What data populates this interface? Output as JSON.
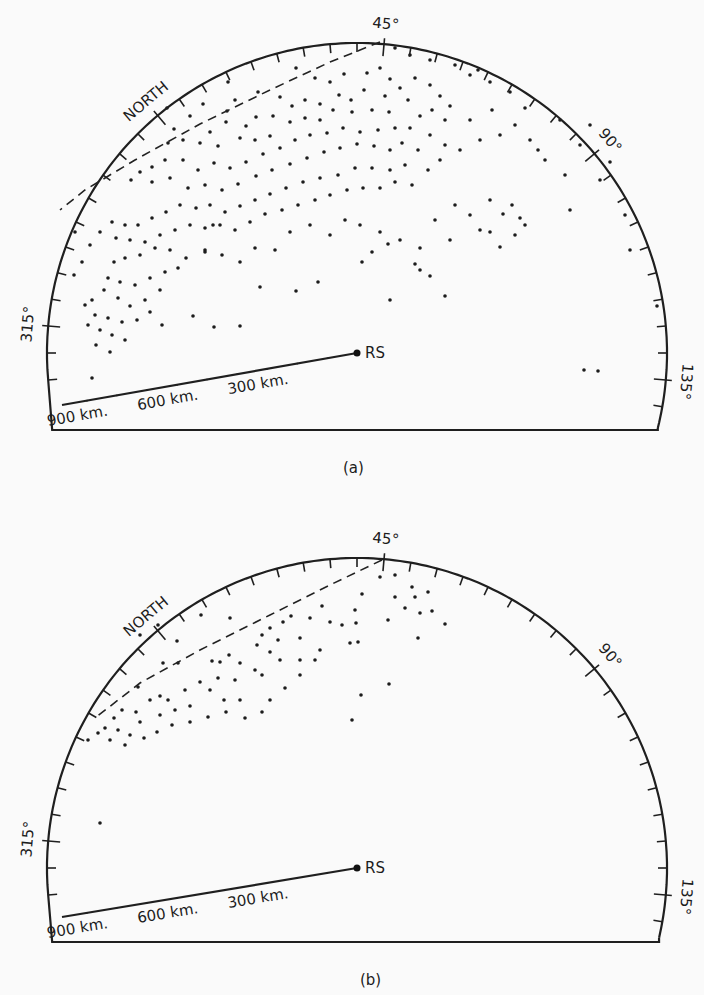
{
  "figure": {
    "panels": [
      {
        "id": "a",
        "caption": "(a)",
        "center": [
          357,
          353
        ],
        "radius": 310,
        "rotation_deg": 5,
        "arc_from_deg": 305,
        "arc_to_deg": 150,
        "baseline_y": 430,
        "range_line_end": [
          62,
          405
        ],
        "north_label": "NORTH",
        "station_label": "RS",
        "bearing_labels": [
          {
            "deg": 45,
            "text": "45°"
          },
          {
            "deg": 90,
            "text": "90°"
          },
          {
            "deg": 135,
            "text": "135°"
          },
          {
            "deg": 315,
            "text": "315°"
          }
        ],
        "range_labels": [
          {
            "km": 300,
            "text": "300 km."
          },
          {
            "km": 600,
            "text": "600 km."
          },
          {
            "km": 900,
            "text": "900 km."
          }
        ],
        "boundary_dashed": [
          [
            380,
            42
          ],
          [
            330,
            62
          ],
          [
            270,
            90
          ],
          [
            200,
            124
          ],
          [
            135,
            160
          ],
          [
            85,
            190
          ],
          [
            60,
            210
          ]
        ],
        "caption_pos": [
          352,
          470
        ]
      },
      {
        "id": "b",
        "caption": "(b)",
        "center": [
          357,
          868
        ],
        "radius": 310,
        "rotation_deg": 5,
        "arc_from_deg": 305,
        "arc_to_deg": 150,
        "baseline_y": 942,
        "range_line_end": [
          62,
          917
        ],
        "north_label": "NORTH",
        "station_label": "RS",
        "bearing_labels": [
          {
            "deg": 45,
            "text": "45°"
          },
          {
            "deg": 90,
            "text": "90°"
          },
          {
            "deg": 135,
            "text": "135°"
          },
          {
            "deg": 315,
            "text": "315°"
          }
        ],
        "range_labels": [
          {
            "km": 300,
            "text": "300 km."
          },
          {
            "km": 600,
            "text": "600 km."
          },
          {
            "km": 900,
            "text": "900 km."
          }
        ],
        "boundary_dashed": [
          [
            382,
            560
          ],
          [
            330,
            585
          ],
          [
            270,
            615
          ],
          [
            200,
            650
          ],
          [
            140,
            683
          ],
          [
            95,
            718
          ]
        ],
        "caption_pos": [
          365,
          980
        ]
      }
    ]
  },
  "chart_data": [
    {
      "type": "scatter",
      "title": "(a)",
      "description": "Polar (bearing/range) plot of echo positions around station RS; dense cluster between ~0° and ~60° bearing at 300–900 km, dashed boundary line near the northern edge",
      "axes": {
        "bearing_ticks_deg": [
          315,
          45,
          90,
          135
        ],
        "range_ticks_km": [
          300,
          600,
          900
        ],
        "tick_interval_deg": 5
      },
      "clusters": [
        {
          "region": "main band NNE",
          "bearing_deg_range": [
            0,
            60
          ],
          "range_km": [
            300,
            950
          ],
          "density": "very high"
        },
        {
          "region": "NW pocket",
          "bearing_deg_range": [
            320,
            345
          ],
          "range_km": [
            700,
            950
          ],
          "density": "high"
        },
        {
          "region": "east scatter",
          "bearing_deg_range": [
            60,
            100
          ],
          "range_km": [
            300,
            900
          ],
          "density": "low"
        },
        {
          "region": "SE isolated",
          "bearing_deg_range": [
            120,
            130
          ],
          "range_km": [
            750,
            900
          ],
          "density": "sparse"
        }
      ]
    },
    {
      "type": "scatter",
      "title": "(b)",
      "description": "Same projection, fewer echoes; clustered in arcs between ~330° and ~60° bearing at 500–950 km",
      "axes": {
        "bearing_ticks_deg": [
          315,
          45,
          90,
          135
        ],
        "range_ticks_km": [
          300,
          600,
          900
        ],
        "tick_interval_deg": 5
      },
      "clusters": [
        {
          "region": "NNE arcs",
          "bearing_deg_range": [
            335,
            40
          ],
          "range_km": [
            550,
            950
          ],
          "density": "moderate"
        },
        {
          "region": "NE group",
          "bearing_deg_range": [
            40,
            60
          ],
          "range_km": [
            650,
            850
          ],
          "density": "low"
        },
        {
          "region": "isolated",
          "bearing_deg_range": [
            300,
            315
          ],
          "range_km": [
            850,
            950
          ],
          "density": "sparse"
        }
      ]
    }
  ],
  "dots": {
    "a": [
      [
        296,
        68
      ],
      [
        315,
        78
      ],
      [
        330,
        82
      ],
      [
        344,
        74
      ],
      [
        367,
        73
      ],
      [
        380,
        68
      ],
      [
        390,
        79
      ],
      [
        385,
        96
      ],
      [
        364,
        90
      ],
      [
        351,
        100
      ],
      [
        339,
        95
      ],
      [
        320,
        104
      ],
      [
        305,
        100
      ],
      [
        292,
        106
      ],
      [
        280,
        97
      ],
      [
        258,
        92
      ],
      [
        235,
        100
      ],
      [
        228,
        82
      ],
      [
        256,
        117
      ],
      [
        273,
        116
      ],
      [
        246,
        126
      ],
      [
        226,
        122
      ],
      [
        210,
        132
      ],
      [
        218,
        146
      ],
      [
        200,
        143
      ],
      [
        183,
        140
      ],
      [
        168,
        143
      ],
      [
        174,
        129
      ],
      [
        167,
        108
      ],
      [
        190,
        116
      ],
      [
        203,
        104
      ],
      [
        227,
        111
      ],
      [
        240,
        138
      ],
      [
        255,
        140
      ],
      [
        270,
        136
      ],
      [
        290,
        122
      ],
      [
        305,
        118
      ],
      [
        320,
        120
      ],
      [
        333,
        110
      ],
      [
        352,
        112
      ],
      [
        372,
        110
      ],
      [
        389,
        112
      ],
      [
        395,
        128
      ],
      [
        378,
        130
      ],
      [
        360,
        132
      ],
      [
        343,
        128
      ],
      [
        327,
        133
      ],
      [
        310,
        135
      ],
      [
        295,
        140
      ],
      [
        280,
        148
      ],
      [
        263,
        154
      ],
      [
        246,
        162
      ],
      [
        230,
        168
      ],
      [
        214,
        163
      ],
      [
        198,
        170
      ],
      [
        183,
        160
      ],
      [
        165,
        160
      ],
      [
        152,
        167
      ],
      [
        140,
        172
      ],
      [
        131,
        180
      ],
      [
        152,
        182
      ],
      [
        170,
        178
      ],
      [
        188,
        188
      ],
      [
        205,
        185
      ],
      [
        222,
        190
      ],
      [
        238,
        184
      ],
      [
        256,
        176
      ],
      [
        272,
        170
      ],
      [
        290,
        164
      ],
      [
        307,
        158
      ],
      [
        324,
        152
      ],
      [
        340,
        148
      ],
      [
        357,
        144
      ],
      [
        374,
        146
      ],
      [
        390,
        150
      ],
      [
        402,
        143
      ],
      [
        410,
        128
      ],
      [
        420,
        116
      ],
      [
        408,
        100
      ],
      [
        400,
        88
      ],
      [
        415,
        78
      ],
      [
        430,
        85
      ],
      [
        440,
        96
      ],
      [
        450,
        106
      ],
      [
        432,
        110
      ],
      [
        445,
        120
      ],
      [
        430,
        135
      ],
      [
        418,
        150
      ],
      [
        405,
        165
      ],
      [
        390,
        170
      ],
      [
        372,
        168
      ],
      [
        355,
        168
      ],
      [
        338,
        175
      ],
      [
        320,
        178
      ],
      [
        303,
        182
      ],
      [
        286,
        188
      ],
      [
        270,
        194
      ],
      [
        255,
        200
      ],
      [
        240,
        206
      ],
      [
        225,
        212
      ],
      [
        210,
        205
      ],
      [
        196,
        208
      ],
      [
        180,
        205
      ],
      [
        166,
        212
      ],
      [
        152,
        218
      ],
      [
        138,
        225
      ],
      [
        125,
        225
      ],
      [
        112,
        222
      ],
      [
        116,
        238
      ],
      [
        130,
        240
      ],
      [
        145,
        242
      ],
      [
        160,
        235
      ],
      [
        175,
        230
      ],
      [
        190,
        225
      ],
      [
        205,
        228
      ],
      [
        220,
        225
      ],
      [
        235,
        230
      ],
      [
        250,
        222
      ],
      [
        265,
        214
      ],
      [
        282,
        210
      ],
      [
        298,
        205
      ],
      [
        315,
        200
      ],
      [
        330,
        195
      ],
      [
        347,
        190
      ],
      [
        363,
        188
      ],
      [
        380,
        188
      ],
      [
        395,
        182
      ],
      [
        412,
        185
      ],
      [
        428,
        170
      ],
      [
        440,
        160
      ],
      [
        445,
        145
      ],
      [
        460,
        150
      ],
      [
        470,
        120
      ],
      [
        480,
        140
      ],
      [
        500,
        135
      ],
      [
        515,
        125
      ],
      [
        525,
        108
      ],
      [
        510,
        92
      ],
      [
        490,
        82
      ],
      [
        470,
        75
      ],
      [
        455,
        65
      ],
      [
        430,
        60
      ],
      [
        410,
        55
      ],
      [
        395,
        48
      ],
      [
        478,
        70
      ],
      [
        492,
        110
      ],
      [
        530,
        140
      ],
      [
        545,
        160
      ],
      [
        560,
        120
      ],
      [
        580,
        145
      ],
      [
        590,
        125
      ],
      [
        610,
        162
      ],
      [
        600,
        180
      ],
      [
        570,
        210
      ],
      [
        525,
        225
      ],
      [
        512,
        205
      ],
      [
        490,
        200
      ],
      [
        480,
        230
      ],
      [
        450,
        240
      ],
      [
        420,
        248
      ],
      [
        400,
        240
      ],
      [
        380,
        232
      ],
      [
        360,
        225
      ],
      [
        345,
        220
      ],
      [
        330,
        235
      ],
      [
        310,
        225
      ],
      [
        290,
        232
      ],
      [
        275,
        250
      ],
      [
        255,
        248
      ],
      [
        240,
        262
      ],
      [
        222,
        255
      ],
      [
        205,
        252
      ],
      [
        186,
        258
      ],
      [
        170,
        250
      ],
      [
        155,
        248
      ],
      [
        140,
        255
      ],
      [
        125,
        258
      ],
      [
        114,
        262
      ],
      [
        108,
        278
      ],
      [
        120,
        282
      ],
      [
        135,
        285
      ],
      [
        150,
        278
      ],
      [
        165,
        272
      ],
      [
        178,
        268
      ],
      [
        160,
        290
      ],
      [
        145,
        300
      ],
      [
        130,
        306
      ],
      [
        118,
        298
      ],
      [
        104,
        290
      ],
      [
        92,
        300
      ],
      [
        95,
        315
      ],
      [
        108,
        318
      ],
      [
        122,
        322
      ],
      [
        137,
        320
      ],
      [
        150,
        312
      ],
      [
        100,
        330
      ],
      [
        112,
        335
      ],
      [
        125,
        340
      ],
      [
        96,
        345
      ],
      [
        110,
        352
      ],
      [
        85,
        305
      ],
      [
        74,
        275
      ],
      [
        82,
        262
      ],
      [
        90,
        245
      ],
      [
        100,
        232
      ],
      [
        75,
        232
      ],
      [
        88,
        325
      ],
      [
        92,
        378
      ],
      [
        214,
        327
      ],
      [
        240,
        326
      ],
      [
        162,
        325
      ],
      [
        193,
        316
      ],
      [
        205,
        250
      ],
      [
        213,
        225
      ],
      [
        260,
        287
      ],
      [
        296,
        291
      ],
      [
        318,
        282
      ],
      [
        362,
        262
      ],
      [
        372,
        252
      ],
      [
        388,
        244
      ],
      [
        415,
        264
      ],
      [
        430,
        276
      ],
      [
        445,
        296
      ],
      [
        490,
        232
      ],
      [
        503,
        214
      ],
      [
        520,
        218
      ],
      [
        625,
        215
      ],
      [
        630,
        250
      ],
      [
        657,
        306
      ],
      [
        584,
        370
      ],
      [
        598,
        371
      ],
      [
        538,
        150
      ],
      [
        565,
        175
      ],
      [
        435,
        220
      ],
      [
        455,
        205
      ],
      [
        470,
        215
      ],
      [
        500,
        247
      ],
      [
        515,
        235
      ],
      [
        390,
        300
      ],
      [
        420,
        270
      ]
    ],
    "b": [
      [
        177,
        641
      ],
      [
        163,
        663
      ],
      [
        178,
        663
      ],
      [
        138,
        687
      ],
      [
        160,
        696
      ],
      [
        212,
        661
      ],
      [
        220,
        662
      ],
      [
        229,
        655
      ],
      [
        240,
        663
      ],
      [
        257,
        645
      ],
      [
        262,
        635
      ],
      [
        270,
        628
      ],
      [
        278,
        640
      ],
      [
        283,
        622
      ],
      [
        291,
        616
      ],
      [
        300,
        638
      ],
      [
        270,
        652
      ],
      [
        255,
        670
      ],
      [
        235,
        680
      ],
      [
        218,
        678
      ],
      [
        200,
        682
      ],
      [
        185,
        690
      ],
      [
        168,
        700
      ],
      [
        150,
        700
      ],
      [
        136,
        712
      ],
      [
        122,
        710
      ],
      [
        114,
        718
      ],
      [
        105,
        728
      ],
      [
        118,
        730
      ],
      [
        130,
        735
      ],
      [
        144,
        738
      ],
      [
        157,
        732
      ],
      [
        172,
        725
      ],
      [
        190,
        722
      ],
      [
        208,
        717
      ],
      [
        226,
        712
      ],
      [
        245,
        718
      ],
      [
        262,
        712
      ],
      [
        270,
        700
      ],
      [
        285,
        688
      ],
      [
        300,
        675
      ],
      [
        315,
        660
      ],
      [
        320,
        650
      ],
      [
        300,
        660
      ],
      [
        280,
        660
      ],
      [
        262,
        675
      ],
      [
        240,
        700
      ],
      [
        224,
        700
      ],
      [
        210,
        690
      ],
      [
        190,
        706
      ],
      [
        175,
        710
      ],
      [
        160,
        715
      ],
      [
        140,
        722
      ],
      [
        125,
        745
      ],
      [
        110,
        740
      ],
      [
        98,
        733
      ],
      [
        88,
        740
      ],
      [
        100,
        823
      ],
      [
        158,
        625
      ],
      [
        140,
        635
      ],
      [
        201,
        615
      ],
      [
        230,
        618
      ],
      [
        380,
        577
      ],
      [
        395,
        597
      ],
      [
        405,
        608
      ],
      [
        415,
        597
      ],
      [
        428,
        592
      ],
      [
        420,
        613
      ],
      [
        432,
        611
      ],
      [
        445,
        624
      ],
      [
        418,
        638
      ],
      [
        388,
        620
      ],
      [
        362,
        594
      ],
      [
        355,
        610
      ],
      [
        356,
        623
      ],
      [
        342,
        625
      ],
      [
        330,
        622
      ],
      [
        350,
        643
      ],
      [
        358,
        642
      ],
      [
        361,
        695
      ],
      [
        389,
        684
      ],
      [
        352,
        720
      ],
      [
        322,
        606
      ],
      [
        310,
        618
      ],
      [
        395,
        575
      ],
      [
        412,
        587
      ]
    ]
  }
}
